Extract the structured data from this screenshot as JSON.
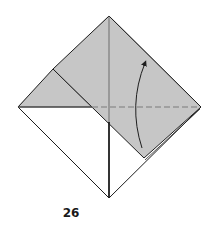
{
  "diagram": {
    "type": "origami-folding-step",
    "step_number": "26",
    "colors": {
      "paper_back": "#ffffff",
      "paper_colored": "#c6c6c6",
      "line": "#1e1e1e",
      "dashed_fold": "#7a7a7a"
    },
    "elements": [
      "square base outline (diamond)",
      "shaded top flap",
      "shaded upper-left triangle",
      "center vertical crease",
      "valley fold dashed line (horizontal)",
      "curved fold arrow pointing up"
    ]
  }
}
